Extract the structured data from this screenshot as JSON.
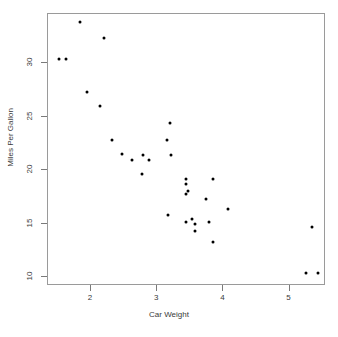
{
  "chart_data": {
    "type": "scatter",
    "title": "",
    "xlabel": "Car Weight",
    "ylabel": "Miles Per Gallon",
    "xlim": [
      1.35,
      5.55
    ],
    "ylim": [
      9.2,
      34.6
    ],
    "xticks": [
      2,
      3,
      4,
      5
    ],
    "xtick_labels": [
      "2",
      "3",
      "4",
      "5"
    ],
    "yticks": [
      10,
      15,
      20,
      25,
      30
    ],
    "ytick_labels": [
      "10",
      "15",
      "20",
      "25",
      "30"
    ],
    "grid": false,
    "legend": false,
    "point_color": "#000000",
    "point_size_px": 3,
    "frame_color": "#9a9a9a",
    "background": "#ffffff",
    "x": [
      2.62,
      2.875,
      2.32,
      3.215,
      3.44,
      3.46,
      3.57,
      3.19,
      3.15,
      3.44,
      3.44,
      4.07,
      3.73,
      3.78,
      5.25,
      5.424,
      5.345,
      2.2,
      1.615,
      1.835,
      2.465,
      3.52,
      3.435,
      3.84,
      3.845,
      1.935,
      2.14,
      1.513,
      3.17,
      2.77,
      3.57,
      2.78
    ],
    "y": [
      21.0,
      21.0,
      22.8,
      21.4,
      18.7,
      18.1,
      14.3,
      24.4,
      22.8,
      19.2,
      17.8,
      16.4,
      17.3,
      15.2,
      10.4,
      10.4,
      14.7,
      32.4,
      30.4,
      33.9,
      21.5,
      15.5,
      15.2,
      13.3,
      19.2,
      27.3,
      26.0,
      30.4,
      15.8,
      19.7,
      15.0,
      21.4
    ]
  }
}
